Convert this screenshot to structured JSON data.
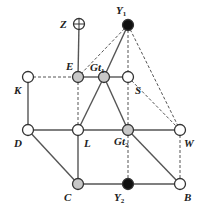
{
  "diagram": {
    "type": "graph",
    "nodes": [
      {
        "id": "Z",
        "label": "Z",
        "sub": "",
        "x": 79,
        "y": 24,
        "style": "crosshair",
        "lx": 60,
        "ly": 28
      },
      {
        "id": "Y1",
        "label": "Y",
        "sub": "1",
        "x": 128,
        "y": 25,
        "style": "black",
        "lx": 116,
        "ly": 14
      },
      {
        "id": "E",
        "label": "E",
        "sub": "",
        "x": 78,
        "y": 77,
        "style": "gray",
        "lx": 66,
        "ly": 70
      },
      {
        "id": "Gt1",
        "label": "Gt",
        "sub": "1",
        "x": 104,
        "y": 77,
        "style": "gray",
        "lx": 90,
        "ly": 71
      },
      {
        "id": "S",
        "label": "S",
        "sub": "",
        "x": 128,
        "y": 77,
        "style": "white",
        "lx": 135,
        "ly": 94
      },
      {
        "id": "K",
        "label": "K",
        "sub": "",
        "x": 28,
        "y": 77,
        "style": "white",
        "lx": 14,
        "ly": 94
      },
      {
        "id": "D",
        "label": "D",
        "sub": "",
        "x": 28,
        "y": 130,
        "style": "white",
        "lx": 14,
        "ly": 147
      },
      {
        "id": "L",
        "label": "L",
        "sub": "",
        "x": 78,
        "y": 130,
        "style": "white",
        "lx": 84,
        "ly": 147
      },
      {
        "id": "Gt2",
        "label": "Gt",
        "sub": "2",
        "x": 128,
        "y": 130,
        "style": "gray",
        "lx": 114,
        "ly": 145
      },
      {
        "id": "W",
        "label": "W",
        "sub": "",
        "x": 180,
        "y": 130,
        "style": "white",
        "lx": 184,
        "ly": 147
      },
      {
        "id": "C",
        "label": "C",
        "sub": "",
        "x": 78,
        "y": 184,
        "style": "gray",
        "lx": 64,
        "ly": 201
      },
      {
        "id": "Y2",
        "label": "Y",
        "sub": "2",
        "x": 128,
        "y": 184,
        "style": "black",
        "lx": 114,
        "ly": 201
      },
      {
        "id": "B",
        "label": "B",
        "sub": "",
        "x": 180,
        "y": 184,
        "style": "white",
        "lx": 184,
        "ly": 201
      }
    ],
    "edges": [
      {
        "from": "Z",
        "to": "E",
        "dashed": false
      },
      {
        "from": "K",
        "to": "E",
        "dashed": true
      },
      {
        "from": "E",
        "to": "Gt1",
        "dashed": false
      },
      {
        "from": "Gt1",
        "to": "S",
        "dashed": false
      },
      {
        "from": "Y1",
        "to": "E",
        "dashed": true
      },
      {
        "from": "Y1",
        "to": "Gt1",
        "dashed": false
      },
      {
        "from": "Y1",
        "to": "S",
        "dashed": true
      },
      {
        "from": "Y1",
        "to": "W",
        "dashed": true
      },
      {
        "from": "S",
        "to": "W",
        "dashed": true
      },
      {
        "from": "S",
        "to": "Gt2",
        "dashed": true
      },
      {
        "from": "E",
        "to": "L",
        "dashed": true
      },
      {
        "from": "Gt1",
        "to": "L",
        "dashed": false
      },
      {
        "from": "Gt1",
        "to": "Gt2",
        "dashed": false
      },
      {
        "from": "K",
        "to": "D",
        "dashed": false
      },
      {
        "from": "D",
        "to": "L",
        "dashed": false
      },
      {
        "from": "L",
        "to": "Gt2",
        "dashed": false
      },
      {
        "from": "Gt2",
        "to": "W",
        "dashed": false
      },
      {
        "from": "D",
        "to": "C",
        "dashed": false
      },
      {
        "from": "L",
        "to": "C",
        "dashed": false
      },
      {
        "from": "C",
        "to": "Y2",
        "dashed": false
      },
      {
        "from": "Y2",
        "to": "B",
        "dashed": false
      },
      {
        "from": "Gt2",
        "to": "B",
        "dashed": false
      },
      {
        "from": "Gt2",
        "to": "Y2",
        "dashed": true
      },
      {
        "from": "W",
        "to": "B",
        "dashed": true
      }
    ],
    "colors": {
      "line": "#555555",
      "gray_fill": "#c8c8c8",
      "black_fill": "#111111",
      "white_fill": "#ffffff",
      "stroke": "#333333"
    }
  }
}
